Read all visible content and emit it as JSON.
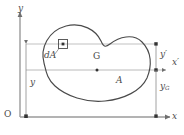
{
  "figure": {
    "background_color": "#ffffff",
    "line_color": "#6f6f6f",
    "text_color": "#4a4a4a"
  },
  "axes": {
    "y_axis_label": "y",
    "x_axis_label": "x",
    "origin_label": "O",
    "x_prime_label": "x",
    "x_prime_prime_mark": "′"
  },
  "region": {
    "area_label": "A",
    "centroid_label": "G",
    "element_label": "dA"
  },
  "dimensions": {
    "y_label": "y",
    "y_prime_label": "y",
    "y_prime_mark": "′",
    "yG_label": "y",
    "yG_subscript": "G"
  },
  "icons": {
    "area_element": "square-element-icon",
    "centroid_point": "dot-icon",
    "axis_arrow": "arrow-icon"
  }
}
